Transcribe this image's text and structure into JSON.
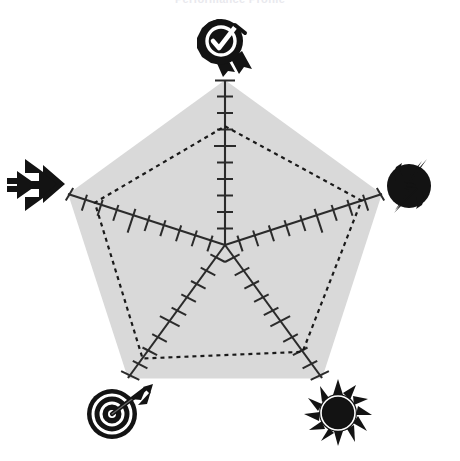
{
  "chart": {
    "title": "Performance Profile",
    "type_label": "radar"
  },
  "chart_data": {
    "type": "radar",
    "title": "Performance Profile",
    "subtitle": "",
    "xlabel": "",
    "ylabel": "",
    "grid": false,
    "legend": "none",
    "rlim": [
      0,
      10
    ],
    "tick_count": 10,
    "categories": [
      "Quality",
      "Power",
      "Brightness",
      "Accuracy",
      "Speed"
    ],
    "angles_deg": [
      90,
      18,
      306,
      234,
      162
    ],
    "series": [
      {
        "name": "Maximum",
        "style": "filled-pentagon",
        "fill": "#d9d9d9",
        "stroke": "none",
        "values": [
          10,
          10,
          10,
          10,
          10
        ]
      },
      {
        "name": "Measured",
        "style": "dashed-outline",
        "fill": "none",
        "stroke": "#1a1a1a",
        "values": [
          7.2,
          8.7,
          8.0,
          8.5,
          8.3
        ]
      }
    ],
    "axis_icons": [
      {
        "category": "Quality",
        "icon": "award-check-seal-icon",
        "position": "top"
      },
      {
        "category": "Power",
        "icon": "lightning-bolt-icon",
        "position": "right"
      },
      {
        "category": "Brightness",
        "icon": "sunburst-icon",
        "position": "bottom-right"
      },
      {
        "category": "Accuracy",
        "icon": "target-arrow-icon",
        "position": "bottom-left"
      },
      {
        "category": "Speed",
        "icon": "fast-forward-arrows-icon",
        "position": "left"
      }
    ]
  },
  "colors": {
    "background": "#ffffff",
    "fill": "#d9d9d9",
    "axis": "#2b2b2b",
    "series": "#1a1a1a",
    "icon": "#111111",
    "title": "#e9e9ee"
  },
  "icons": {
    "quality": "award-check-seal-icon",
    "power": "lightning-bolt-icon",
    "brightness": "sunburst-icon",
    "accuracy": "target-arrow-icon",
    "speed": "fast-forward-arrows-icon"
  }
}
